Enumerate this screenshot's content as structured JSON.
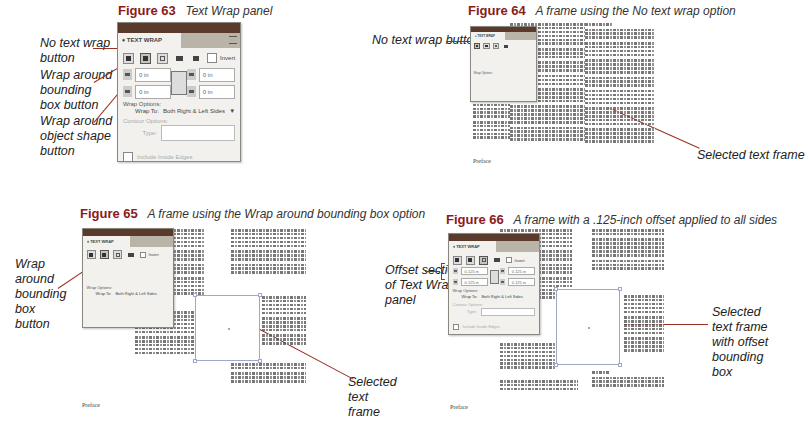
{
  "figures": [
    {
      "number": "Figure 63",
      "caption": "Text Wrap panel",
      "callouts": [
        "No text wrap button",
        "Wrap around bounding box button",
        "Wrap around object shape button"
      ]
    },
    {
      "number": "Figure 64",
      "caption": "A frame using the No text wrap option",
      "callouts": [
        "No text wrap button",
        "Selected text frame"
      ],
      "page_label": "Preface"
    },
    {
      "number": "Figure 65",
      "caption": "A frame using the Wrap around bounding box option",
      "callouts": [
        "Wrap around bounding box button",
        "Selected text frame"
      ],
      "page_label": "Preface"
    },
    {
      "number": "Figure 66",
      "caption": "A frame with a .125-inch offset applied to all sides",
      "callouts": [
        "Offset section of Text Wrap panel",
        "Selected text frame with offset bounding box"
      ],
      "page_label": "Preface"
    }
  ],
  "callout_text": {
    "f63_no_wrap": "No text wrap button",
    "f63_bbox": "Wrap around bounding box button",
    "f63_shape": "Wrap around object shape button",
    "f64_no_wrap": "No text wrap button",
    "f64_selected": "Selected text frame",
    "f65_bbox": "Wrap around bounding box button",
    "f65_selected": "Selected text frame",
    "f66_offset": "Offset section of Text Wrap panel",
    "f66_selected": "Selected text frame with offset bounding box"
  },
  "panel": {
    "tab_label": "♦ TEXT WRAP",
    "invert_label": "Invert",
    "offset_zero": "0 in",
    "offset_125": "0.125 in",
    "wrap_options_label": "Wrap Options:",
    "wrap_to_label": "Wrap To:",
    "wrap_to_value": "Both Right & Left Sides",
    "contour_options_label": "Contour Options:",
    "type_label": "Type:",
    "include_inside_edges_label": "Include Inside Edges"
  },
  "page_label": "Preface",
  "colors": {
    "figure_number": "#8b1a1a",
    "callout_line": "#9b3022",
    "panel_titlebar": "#5a3a2a",
    "frame_border": "#9fa8c8"
  }
}
